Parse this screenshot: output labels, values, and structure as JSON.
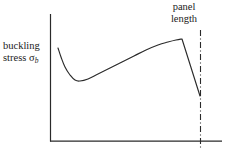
{
  "figure": {
    "background_color": "#ffffff",
    "ink_color": "#2a2a2a",
    "width": 225,
    "height": 160
  },
  "annotations": {
    "y_axis_label": {
      "line1": "buckling",
      "line2_prefix": "stress ",
      "line2_symbol": "σ",
      "line2_subscript": "b",
      "full_text": "buckling stress σb"
    },
    "panel_length": {
      "line1": "panel",
      "line2": "length",
      "full_text": "panel length"
    }
  },
  "chart_data": {
    "type": "line",
    "title": "",
    "xlabel": "",
    "ylabel": "buckling stress σb",
    "grid": false,
    "legend": null,
    "axes": {
      "style": "L-shaped (left spine + bottom spine), no tick marks, no tick labels",
      "x_origin_px": 50,
      "x_end_px": 222,
      "y_top_px": 14,
      "y_baseline_px": 141
    },
    "series": [
      {
        "name": "buckling stress curve",
        "style": "solid",
        "color": "#2a2a2a",
        "comment": "x,y given in figure pixel coordinates; y grows downward",
        "points_px": [
          [
            58,
            48
          ],
          [
            61,
            57
          ],
          [
            65,
            67
          ],
          [
            70,
            75
          ],
          [
            75,
            80
          ],
          [
            80,
            81
          ],
          [
            88,
            79
          ],
          [
            98,
            74
          ],
          [
            110,
            68
          ],
          [
            122,
            62
          ],
          [
            134,
            56
          ],
          [
            146,
            50
          ],
          [
            158,
            45
          ],
          [
            168,
            42
          ],
          [
            176,
            40
          ],
          [
            182,
            39
          ],
          [
            186,
            47
          ],
          [
            190,
            62
          ],
          [
            195,
            79
          ],
          [
            200,
            96
          ]
        ],
        "features": {
          "start": [
            58,
            48
          ],
          "local_minimum": [
            80,
            81
          ],
          "peak": [
            182,
            39
          ],
          "drop_end": [
            200,
            96
          ]
        }
      }
    ],
    "reference_lines": [
      {
        "name": "panel length",
        "orientation": "vertical",
        "style": "dash-dot",
        "color": "#2a2a2a",
        "x_px": 200,
        "y_start_px": 30,
        "y_end_px": 148
      }
    ]
  }
}
